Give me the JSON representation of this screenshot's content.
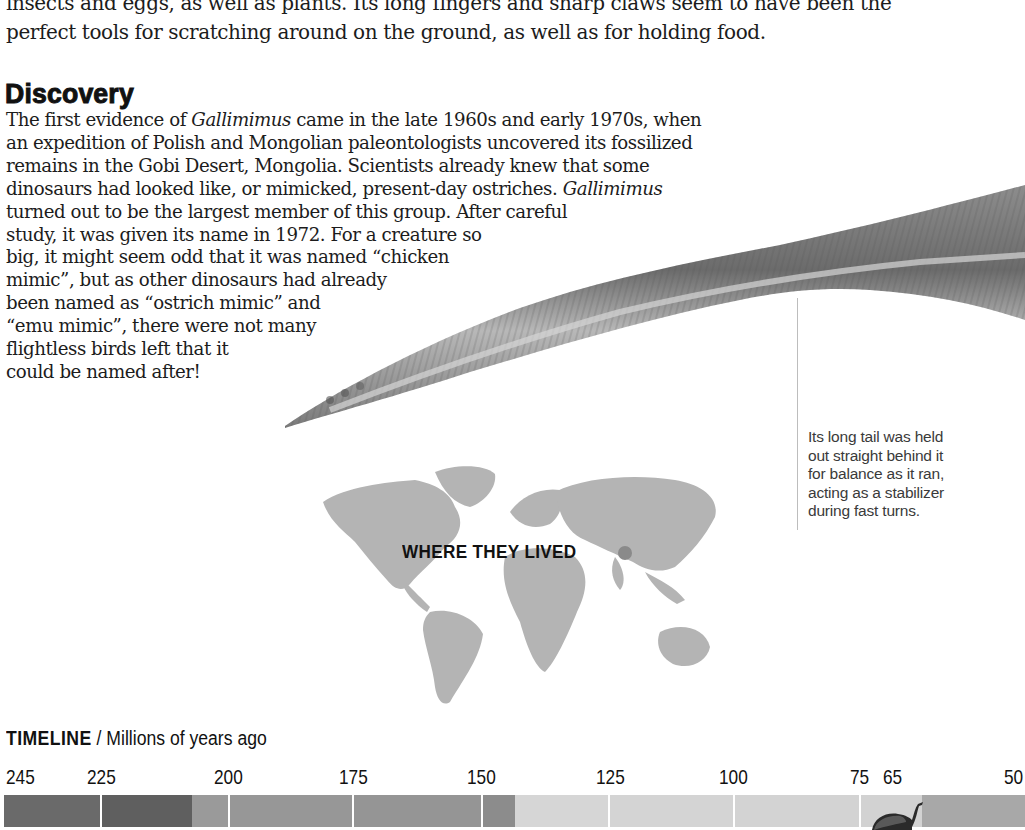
{
  "top_paragraph": {
    "lines": [
      "insects and eggs, as well as plants. Its long fingers and sharp claws seem to have been the",
      "perfect tools for scratching around on the ground, as well as for holding food."
    ]
  },
  "discovery": {
    "heading": "Discovery",
    "lines": [
      {
        "pre": "The first evidence of ",
        "italic": "Gallimimus",
        "post": " came in the late 1960s and early 1970s, when"
      },
      {
        "pre": "an expedition of Polish and Mongolian paleontologists uncovered its fossilized",
        "italic": "",
        "post": ""
      },
      {
        "pre": "remains in the Gobi Desert, Mongolia. Scientists already knew that some",
        "italic": "",
        "post": ""
      },
      {
        "pre": "dinosaurs had looked like, or mimicked, present-day ostriches. ",
        "italic": "Gallimimus",
        "post": ""
      },
      {
        "pre": "turned out to be the largest member of this group. After careful",
        "italic": "",
        "post": ""
      },
      {
        "pre": "study, it was given its name in 1972. For a creature so",
        "italic": "",
        "post": ""
      },
      {
        "pre": "big, it might seem odd that it was named “chicken",
        "italic": "",
        "post": ""
      },
      {
        "pre": "mimic”, but as other dinosaurs had already",
        "italic": "",
        "post": ""
      },
      {
        "pre": "been named as “ostrich mimic” and",
        "italic": "",
        "post": ""
      },
      {
        "pre": "“emu mimic”, there were not many",
        "italic": "",
        "post": ""
      },
      {
        "pre": "flightless birds left that it",
        "italic": "",
        "post": ""
      },
      {
        "pre": "could be named after!",
        "italic": "",
        "post": ""
      }
    ]
  },
  "tail_callout": {
    "lines": [
      "Its long tail was held",
      "out straight behind it",
      "for balance as it ran,",
      "acting as a stabilizer",
      "during fast turns."
    ]
  },
  "map": {
    "label": "WHERE THEY LIVED",
    "marker_color": "#8a8a8a",
    "marker_icon": "location-dot-icon"
  },
  "timeline": {
    "title_bold": "TIMELINE",
    "title_rest": " / Millions of years ago",
    "ticks": [
      {
        "label": "245",
        "x": 6
      },
      {
        "label": "225",
        "x": 87
      },
      {
        "label": "200",
        "x": 214
      },
      {
        "label": "175",
        "x": 339
      },
      {
        "label": "150",
        "x": 467
      },
      {
        "label": "125",
        "x": 596
      },
      {
        "label": "100",
        "x": 719
      },
      {
        "label": "75",
        "x": 850
      },
      {
        "label": "65",
        "x": 883
      },
      {
        "label": "50",
        "x": 1004
      }
    ],
    "segments": [
      {
        "from": 4,
        "to": 100,
        "color": "#6a6a6a"
      },
      {
        "from": 102,
        "to": 192,
        "color": "#5f5f5f"
      },
      {
        "from": 192,
        "to": 228,
        "color": "#9a9a9a"
      },
      {
        "from": 229,
        "to": 352,
        "color": "#979797"
      },
      {
        "from": 353,
        "to": 481,
        "color": "#959595"
      },
      {
        "from": 482,
        "to": 515,
        "color": "#8c8c8c"
      },
      {
        "from": 515,
        "to": 608,
        "color": "#d6d6d6"
      },
      {
        "from": 609,
        "to": 733,
        "color": "#d4d4d4"
      },
      {
        "from": 734,
        "to": 859,
        "color": "#d3d3d3"
      },
      {
        "from": 860,
        "to": 922,
        "color": "#d2d2d2"
      },
      {
        "from": 922,
        "to": 1025,
        "color": "#a8a8a8"
      }
    ],
    "dividers": [
      100,
      228,
      352,
      481,
      608,
      733,
      859
    ],
    "extinction_icon": "dinosaur-silhouette-icon"
  }
}
